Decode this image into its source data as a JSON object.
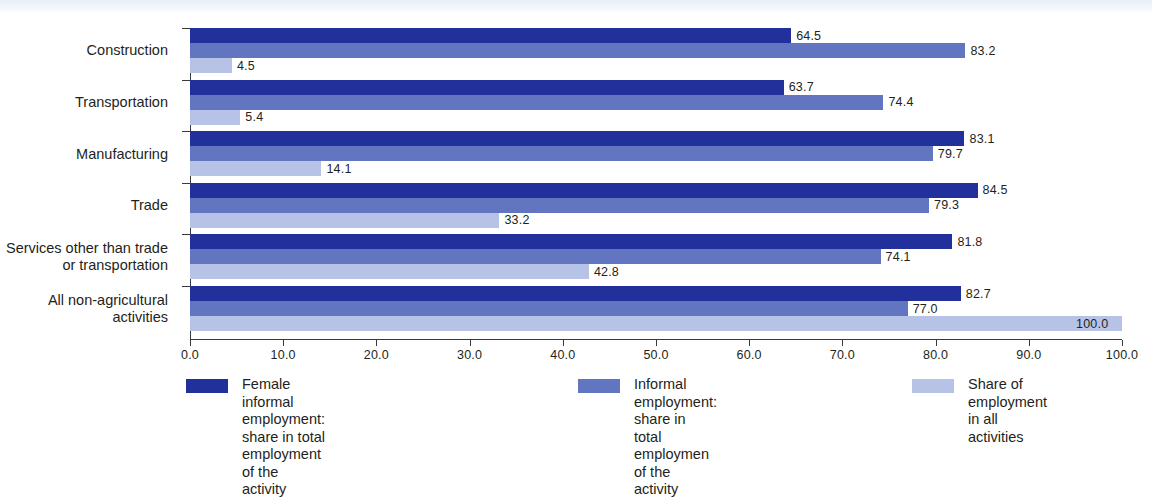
{
  "chart_data": {
    "type": "bar",
    "orientation": "horizontal",
    "title": "",
    "xlabel": "",
    "ylabel": "",
    "xlim": [
      0,
      100
    ],
    "xticks": [
      "0.0",
      "10.0",
      "20.0",
      "30.0",
      "40.0",
      "50.0",
      "60.0",
      "70.0",
      "80.0",
      "90.0",
      "100.0"
    ],
    "grid": false,
    "legend_position": "bottom",
    "categories": [
      "Construction",
      "Transportation",
      "Manufacturing",
      "Trade",
      "Services other than trade\nor transportation",
      "All non-agricultural\nactivities"
    ],
    "series": [
      {
        "name": "Female informal employment:\nshare in total employment of the activity",
        "color": "#22309c",
        "values": [
          64.5,
          63.7,
          83.1,
          84.5,
          81.8,
          82.7
        ],
        "labels": [
          "64.5",
          "63.7",
          "83.1",
          "84.5",
          "81.8",
          "82.7"
        ]
      },
      {
        "name": "Informal employment:\nshare in total employmen of the activity",
        "color": "#6275c0",
        "values": [
          83.2,
          74.4,
          79.7,
          79.3,
          74.1,
          77.0
        ],
        "labels": [
          "83.2",
          "74.4",
          "79.7",
          "79.3",
          "74.1",
          "77.0"
        ]
      },
      {
        "name": "Share of employment\nin all activities",
        "color": "#b6c3e6",
        "values": [
          4.5,
          5.4,
          14.1,
          33.2,
          42.8,
          100.0
        ],
        "labels": [
          "4.5",
          "5.4",
          "14.1",
          "33.2",
          "42.8",
          "100.0"
        ]
      }
    ]
  },
  "legend": [
    {
      "label": "Female informal employment:\nshare in total employment of the activity",
      "color": "#22309c"
    },
    {
      "label": "Informal employment:\nshare in total employmen of the activity",
      "color": "#6275c0"
    },
    {
      "label": "Share of employment\nin all activities",
      "color": "#b6c3e6"
    }
  ]
}
